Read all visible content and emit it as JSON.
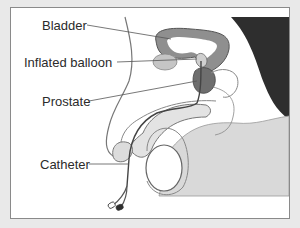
{
  "diagram": {
    "type": "medical-anatomy-illustration",
    "labels": [
      {
        "id": "bladder",
        "text": "Bladder"
      },
      {
        "id": "inflated-balloon",
        "text": "Inflated balloon"
      },
      {
        "id": "prostate",
        "text": "Prostate"
      },
      {
        "id": "catheter",
        "text": "Catheter"
      }
    ]
  },
  "colors": {
    "background": "#e9e9e9",
    "panel": "#ffffff",
    "border": "#8a8a8a",
    "tissue_light": "#e6e6e6",
    "tissue_mid": "#bdbdbd",
    "organ_dark": "#6e6e6e",
    "dark_region": "#2e2e2e",
    "leader_line": "#555555",
    "label_text": "#2b2b2b"
  }
}
